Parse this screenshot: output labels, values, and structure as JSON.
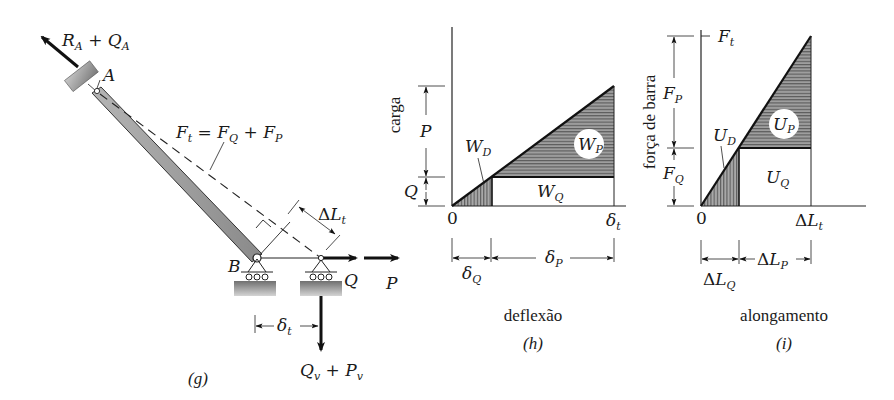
{
  "figure_g": {
    "caption": "(g)",
    "reaction_A": {
      "main": "R",
      "sub1": "A",
      "plus": " + ",
      "main2": "Q",
      "sub2": "A"
    },
    "joint_A": "A",
    "joint_B": "B",
    "bar_force": {
      "lhs": "F",
      "lhs_sub": "t",
      "eq": " = ",
      "t1": "F",
      "t1_sub": "Q",
      "plus": " + ",
      "t2": "F",
      "t2_sub": "P"
    },
    "elongation": {
      "delta": "Δ",
      "main": "L",
      "sub": "t"
    },
    "load_Q": "Q",
    "load_P": "P",
    "displacement": {
      "main": "δ",
      "sub": "t"
    },
    "vertical_reaction": {
      "m1": "Q",
      "s1": "v",
      "plus": " + ",
      "m2": "P",
      "s2": "v"
    }
  },
  "figure_h": {
    "caption": "(h)",
    "xlabel": "deflexão",
    "ylabel": "carga",
    "origin": "0",
    "x_end": {
      "main": "δ",
      "sub": "t"
    },
    "dim_P": "P",
    "dim_Q": "Q",
    "area_WD": {
      "main": "W",
      "sub": "D"
    },
    "area_WP": {
      "main": "W",
      "sub": "P"
    },
    "area_WQ": {
      "main": "W",
      "sub": "Q"
    },
    "dim_dQ": {
      "main": "δ",
      "sub": "Q"
    },
    "dim_dP": {
      "main": "δ",
      "sub": "P"
    }
  },
  "figure_i": {
    "caption": "(i)",
    "xlabel": "alongamento",
    "ylabel": "força de barra",
    "origin": "0",
    "top": {
      "main": "F",
      "sub": "t"
    },
    "x_end": {
      "delta": "Δ",
      "main": "L",
      "sub": "t"
    },
    "dim_FP": {
      "main": "F",
      "sub": "P"
    },
    "dim_FQ": {
      "main": "F",
      "sub": "Q"
    },
    "area_UD": {
      "main": "U",
      "sub": "D"
    },
    "area_UP": {
      "main": "U",
      "sub": "P"
    },
    "area_UQ": {
      "main": "U",
      "sub": "Q"
    },
    "dim_LQ": {
      "delta": "Δ",
      "main": "L",
      "sub": "Q"
    },
    "dim_LP": {
      "delta": "Δ",
      "main": "L",
      "sub": "P"
    }
  },
  "colors": {
    "ink": "#1a1a1a",
    "shade": "#8c8c8c",
    "bar": "#9a9a9a"
  }
}
